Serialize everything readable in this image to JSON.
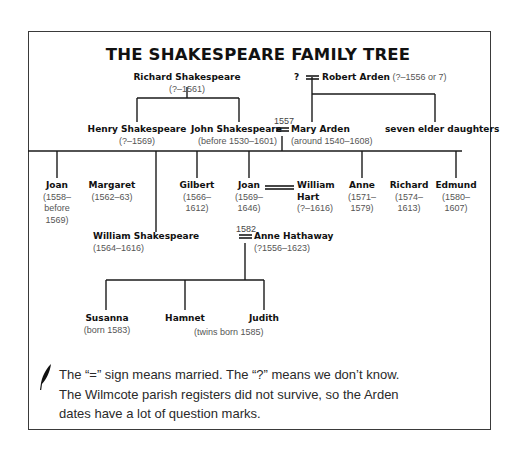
{
  "title": "THE SHAKESPEARE FAMILY TREE",
  "people": {
    "richard": {
      "name": "Richard Shakespeare",
      "dates": "(?–1561)"
    },
    "unknown_wife": {
      "name": "?"
    },
    "robert": {
      "name": "Robert Arden",
      "dates": "(?–1556 or 7)"
    },
    "henry": {
      "name": "Henry Shakespeare",
      "dates": "(?–1569)"
    },
    "john": {
      "name": "John Shakespeare",
      "dates": "(before 1530–1601)"
    },
    "mary": {
      "name": "Mary Arden",
      "dates": "(around 1540–1608)"
    },
    "elder_daughters": {
      "name": "seven elder daughters"
    },
    "joan1": {
      "name": "Joan",
      "dates_l1": "(1558–",
      "dates_l2": "before",
      "dates_l3": "1569)"
    },
    "margaret": {
      "name": "Margaret",
      "dates": "(1562–63)"
    },
    "gilbert": {
      "name": "Gilbert",
      "dates_l1": "(1566–",
      "dates_l2": "1612)"
    },
    "joan2": {
      "name": "Joan",
      "dates_l1": "(1569–",
      "dates_l2": "1646)"
    },
    "william_hart": {
      "name_l1": "William",
      "name_l2": "Hart",
      "dates": "(?–1616)"
    },
    "anne": {
      "name": "Anne",
      "dates_l1": "(1571–",
      "dates_l2": "1579)"
    },
    "richard2": {
      "name": "Richard",
      "dates_l1": "(1574–",
      "dates_l2": "1613)"
    },
    "edmund": {
      "name": "Edmund",
      "dates_l1": "(1580–",
      "dates_l2": "1607)"
    },
    "william": {
      "name": "William Shakespeare",
      "dates": "(1564–1616)"
    },
    "anne_hathaway": {
      "name": "Anne Hathaway",
      "dates": "(?1556–1623)"
    },
    "susanna": {
      "name": "Susanna",
      "dates": "(born 1583)"
    },
    "hamnet": {
      "name": "Hamnet"
    },
    "judith": {
      "name": "Judith"
    },
    "twins_note": "(twins born 1585)"
  },
  "marriages": {
    "john_mary_year": "1557",
    "william_anne_year": "1582"
  },
  "note": {
    "icon": "quill-icon",
    "line1": "The “=” sign means married. The “?” means we don’t know.",
    "line2": "The Wilmcote parish registers did not survive, so the Arden",
    "line3": "dates have a lot of question marks."
  }
}
